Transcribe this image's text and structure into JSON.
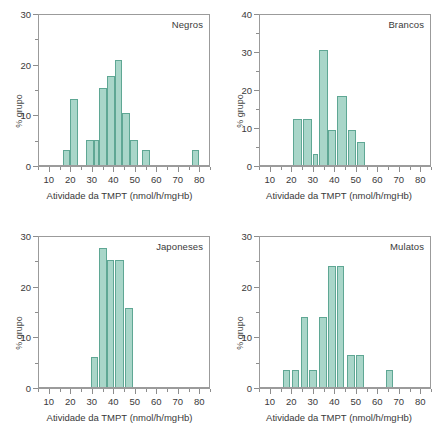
{
  "figure": {
    "axis_label_x": "Atividade da TMPT (nmol/h/mgHb)",
    "axis_label_y": "% grupo",
    "bar_fill": "#a9d6c9",
    "bar_stroke": "#5fa794",
    "axis_color": "#9b9b9b"
  },
  "chart_data": [
    {
      "type": "bar",
      "title": "Negros",
      "xlabel": "Atividade da TMPT (nmol/h/mgHb)",
      "ylabel": "% grupo",
      "xlim": [
        5,
        85
      ],
      "ylim": [
        0,
        30
      ],
      "xticks": [
        10,
        20,
        30,
        40,
        50,
        60,
        70,
        80
      ],
      "yticks": [
        0,
        10,
        20,
        30
      ],
      "yticks_minor": [
        5,
        15,
        25
      ],
      "grid": false,
      "bin_width": 3.6,
      "bins": [
        {
          "x0": 16.0,
          "x1": 19.6,
          "value": 2.9
        },
        {
          "x0": 19.6,
          "x1": 23.2,
          "value": 13.0
        },
        {
          "x0": 23.2,
          "x1": 26.8,
          "value": 0.0
        },
        {
          "x0": 26.8,
          "x1": 30.4,
          "value": 5.0
        },
        {
          "x0": 30.4,
          "x1": 33.0,
          "value": 5.0
        },
        {
          "x0": 33.0,
          "x1": 36.6,
          "value": 15.2
        },
        {
          "x0": 36.6,
          "x1": 40.2,
          "value": 17.6
        },
        {
          "x0": 40.2,
          "x1": 43.8,
          "value": 20.8
        },
        {
          "x0": 43.8,
          "x1": 47.4,
          "value": 10.3
        },
        {
          "x0": 47.4,
          "x1": 51.0,
          "value": 5.0
        },
        {
          "x0": 53.0,
          "x1": 56.6,
          "value": 2.9
        },
        {
          "x0": 76.0,
          "x1": 79.6,
          "value": 2.9
        }
      ]
    },
    {
      "type": "bar",
      "title": "Brancos",
      "xlabel": "Atividade da TMPT (nmol/h/mgHb)",
      "ylabel": "% grupo",
      "xlim": [
        5,
        85
      ],
      "ylim": [
        0,
        40
      ],
      "xticks": [
        10,
        20,
        30,
        40,
        50,
        60,
        70,
        80
      ],
      "yticks": [
        0,
        10,
        20,
        30,
        40
      ],
      "yticks_minor": [
        5,
        15,
        25,
        35
      ],
      "grid": false,
      "bin_width": 4.2,
      "bins": [
        {
          "x0": 20.5,
          "x1": 24.7,
          "value": 12.1
        },
        {
          "x0": 25.0,
          "x1": 29.2,
          "value": 12.1
        },
        {
          "x0": 29.5,
          "x1": 32.0,
          "value": 3.0
        },
        {
          "x0": 32.5,
          "x1": 36.7,
          "value": 30.3
        },
        {
          "x0": 36.8,
          "x1": 40.5,
          "value": 9.1
        },
        {
          "x0": 41.0,
          "x1": 45.5,
          "value": 18.2
        },
        {
          "x0": 46.0,
          "x1": 49.8,
          "value": 9.1
        },
        {
          "x0": 50.2,
          "x1": 54.0,
          "value": 6.1
        }
      ]
    },
    {
      "type": "bar",
      "title": "Japoneses",
      "xlabel": "Atividade da TMPT (nmol/h/mgHb)",
      "ylabel": "% grupo",
      "xlim": [
        5,
        85
      ],
      "ylim": [
        0,
        30
      ],
      "xticks": [
        10,
        20,
        30,
        40,
        50,
        60,
        70,
        80
      ],
      "yticks": [
        0,
        10,
        20,
        30
      ],
      "yticks_minor": [
        5,
        15,
        25
      ],
      "grid": false,
      "bin_width": 3.5,
      "bins": [
        {
          "x0": 29.0,
          "x1": 32.5,
          "value": 6.0
        },
        {
          "x0": 33.0,
          "x1": 36.5,
          "value": 27.5
        },
        {
          "x0": 36.5,
          "x1": 40.0,
          "value": 25.0
        },
        {
          "x0": 40.5,
          "x1": 44.5,
          "value": 25.0
        },
        {
          "x0": 45.0,
          "x1": 48.8,
          "value": 15.5
        }
      ]
    },
    {
      "type": "bar",
      "title": "Mulatos",
      "xlabel": "Atividade da TMPT (nmol/h/mgHb)",
      "ylabel": "% grupo",
      "xlim": [
        5,
        85
      ],
      "ylim": [
        0,
        30
      ],
      "xticks": [
        10,
        20,
        30,
        40,
        50,
        60,
        70,
        80
      ],
      "yticks": [
        0,
        10,
        20,
        30
      ],
      "yticks_minor": [
        5,
        15,
        25
      ],
      "grid": false,
      "bin_width": 3.6,
      "bins": [
        {
          "x0": 15.5,
          "x1": 19.0,
          "value": 3.3
        },
        {
          "x0": 19.8,
          "x1": 23.0,
          "value": 3.3
        },
        {
          "x0": 24.0,
          "x1": 27.5,
          "value": 13.8
        },
        {
          "x0": 28.0,
          "x1": 31.5,
          "value": 3.3
        },
        {
          "x0": 32.5,
          "x1": 36.0,
          "value": 13.8
        },
        {
          "x0": 36.8,
          "x1": 40.3,
          "value": 23.8
        },
        {
          "x0": 40.6,
          "x1": 44.2,
          "value": 23.8
        },
        {
          "x0": 45.5,
          "x1": 49.0,
          "value": 6.3
        },
        {
          "x0": 49.6,
          "x1": 53.2,
          "value": 6.3
        },
        {
          "x0": 63.5,
          "x1": 67.0,
          "value": 3.3
        }
      ]
    }
  ]
}
